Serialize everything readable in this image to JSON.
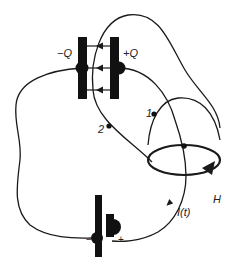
{
  "diagram": {
    "labels": {
      "left_plate_charge": "−Q",
      "right_plate_charge": "+Q",
      "point_1": "1",
      "point_2": "2",
      "loop_label": "H",
      "current_label": "I(t)",
      "battery_minus": "−",
      "battery_plus": "+"
    },
    "colors": {
      "ink": "#1a1a1a",
      "background": "#ffffff"
    },
    "components": [
      "capacitor",
      "battery",
      "wire",
      "amperian-loop",
      "surface-1",
      "surface-2",
      "field-lines"
    ]
  }
}
